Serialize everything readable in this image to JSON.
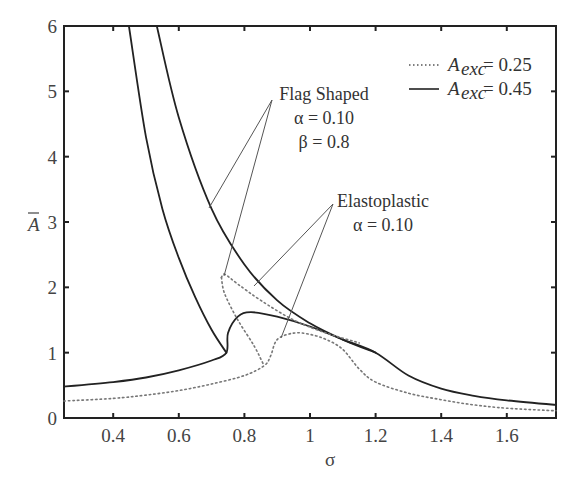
{
  "chart_data": {
    "type": "line",
    "title": "",
    "xlabel": "σ",
    "ylabel": "Ā",
    "xlim": [
      0.25,
      1.75
    ],
    "ylim": [
      0,
      6
    ],
    "xticks": [
      "0.4",
      "0.6",
      "0.8",
      "1",
      "1.2",
      "1.4",
      "1.6"
    ],
    "xtick_values": [
      0.4,
      0.6,
      0.8,
      1.0,
      1.2,
      1.4,
      1.6
    ],
    "yticks": [
      "0",
      "1",
      "2",
      "3",
      "4",
      "5",
      "6"
    ],
    "ytick_values": [
      0,
      1,
      2,
      3,
      4,
      5,
      6
    ],
    "grid": false,
    "legend_position": "upper right",
    "legend": [
      {
        "label": "A_exc = 0.25",
        "base": "A",
        "sub": "exc",
        "value": "= 0.25",
        "style": "dotted"
      },
      {
        "label": "A_exc = 0.45",
        "base": "A",
        "sub": "exc",
        "value": "= 0.45",
        "style": "solid"
      }
    ],
    "annotations": [
      {
        "lines": [
          "Flag Shaped",
          "α = 0.10",
          "β = 0.8"
        ]
      },
      {
        "lines": [
          "Elastoplastic",
          "α = 0.10"
        ]
      }
    ],
    "series": [
      {
        "name": "Flag Shaped, A_exc = 0.45 (left branch)",
        "style": "solid",
        "x": [
          0.448,
          0.5,
          0.55,
          0.6,
          0.65,
          0.7,
          0.745
        ],
        "y": [
          6.0,
          4.3,
          3.2,
          2.45,
          1.85,
          1.35,
          1.0
        ]
      },
      {
        "name": "Flag Shaped, A_exc = 0.45 (upper branch)",
        "style": "solid",
        "x": [
          0.533,
          0.6,
          0.7,
          0.8,
          0.9,
          1.0,
          1.1,
          1.2
        ],
        "y": [
          6.0,
          4.6,
          3.2,
          2.35,
          1.8,
          1.45,
          1.2,
          1.0
        ]
      },
      {
        "name": "A_exc = 0.45 (lower branch)",
        "style": "solid",
        "x": [
          0.25,
          0.4,
          0.5,
          0.6,
          0.7,
          0.745,
          0.75,
          0.78,
          0.82,
          0.9,
          1.0,
          1.1,
          1.2,
          1.3,
          1.4,
          1.5,
          1.6,
          1.75
        ],
        "y": [
          0.48,
          0.55,
          0.62,
          0.73,
          0.88,
          1.0,
          1.3,
          1.55,
          1.62,
          1.55,
          1.4,
          1.2,
          1.0,
          0.65,
          0.45,
          0.34,
          0.27,
          0.2
        ]
      },
      {
        "name": "A_exc = 0.25",
        "style": "dotted",
        "x": [
          0.25,
          0.4,
          0.5,
          0.6,
          0.7,
          0.8,
          0.86,
          0.88,
          0.9,
          0.95,
          1.0,
          1.05,
          1.1,
          1.15,
          1.2,
          1.3,
          1.4,
          1.5,
          1.6,
          1.75
        ],
        "y": [
          0.26,
          0.3,
          0.35,
          0.42,
          0.52,
          0.65,
          0.8,
          0.95,
          1.2,
          1.3,
          1.28,
          1.2,
          1.05,
          0.75,
          0.55,
          0.38,
          0.28,
          0.2,
          0.15,
          0.11
        ]
      },
      {
        "name": "Flag Shaped, A_exc = 0.25 (upper)",
        "style": "dotted",
        "x": [
          0.73,
          0.74,
          0.78,
          0.85,
          0.95,
          1.05,
          1.15
        ],
        "y": [
          2.15,
          2.2,
          2.05,
          1.8,
          1.5,
          1.3,
          1.15
        ]
      },
      {
        "name": "Flag Shaped, A_exc = 0.25 (lower)",
        "style": "dotted",
        "x": [
          0.73,
          0.74,
          0.78,
          0.83,
          0.86
        ],
        "y": [
          2.15,
          1.9,
          1.5,
          1.1,
          0.8
        ]
      }
    ]
  }
}
